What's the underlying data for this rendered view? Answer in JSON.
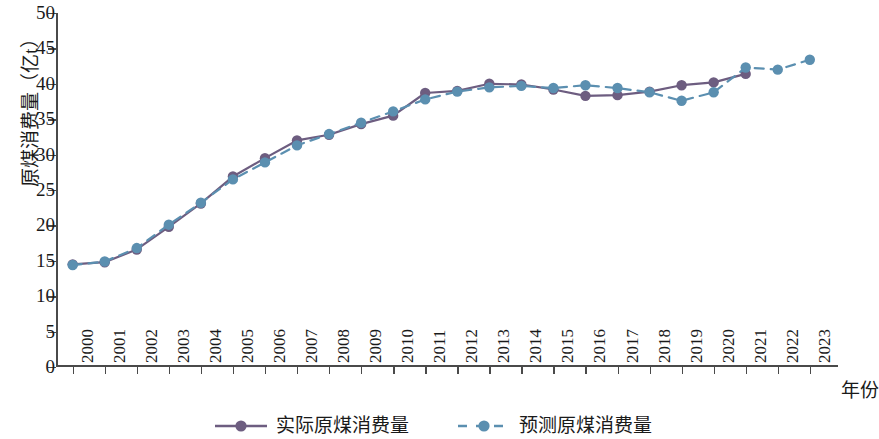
{
  "chart_data": {
    "type": "line",
    "title": "",
    "xlabel": "年份",
    "ylabel": "原煤消费量（亿t）",
    "ylim": [
      0,
      50
    ],
    "ytick_step": 5,
    "yticks": [
      "0",
      "5",
      "10",
      "15",
      "20",
      "25",
      "30",
      "35",
      "40",
      "45",
      "50"
    ],
    "grid": false,
    "legend_position": "bottom-center",
    "categories": [
      "2000",
      "2001",
      "2002",
      "2003",
      "2004",
      "2005",
      "2006",
      "2007",
      "2008",
      "2009",
      "2010",
      "2011",
      "2012",
      "2013",
      "2014",
      "2015",
      "2016",
      "2017",
      "2018",
      "2019",
      "2020",
      "2021",
      "2022",
      "2023"
    ],
    "series": [
      {
        "name": "实际原煤消费量",
        "style": "solid",
        "color": "#6d5d80",
        "marker": "circle",
        "values": [
          14.5,
          14.8,
          16.6,
          19.8,
          23.1,
          26.9,
          29.5,
          32.0,
          32.8,
          34.3,
          35.5,
          38.7,
          39.0,
          40.0,
          39.9,
          39.2,
          38.3,
          38.4,
          38.9,
          39.8,
          40.2,
          41.4,
          null,
          null
        ]
      },
      {
        "name": "预测原煤消费量",
        "style": "dashed",
        "color": "#5b8fb0",
        "marker": "circle",
        "values": [
          14.4,
          14.9,
          16.8,
          20.1,
          23.2,
          26.5,
          28.9,
          31.3,
          32.9,
          34.5,
          36.1,
          37.8,
          38.9,
          39.5,
          39.7,
          39.4,
          39.8,
          39.4,
          38.8,
          37.6,
          38.8,
          42.3,
          42.0,
          43.4
        ]
      }
    ]
  },
  "legend": {
    "items": [
      {
        "label": "实际原煤消费量"
      },
      {
        "label": "预测原煤消费量"
      }
    ]
  }
}
